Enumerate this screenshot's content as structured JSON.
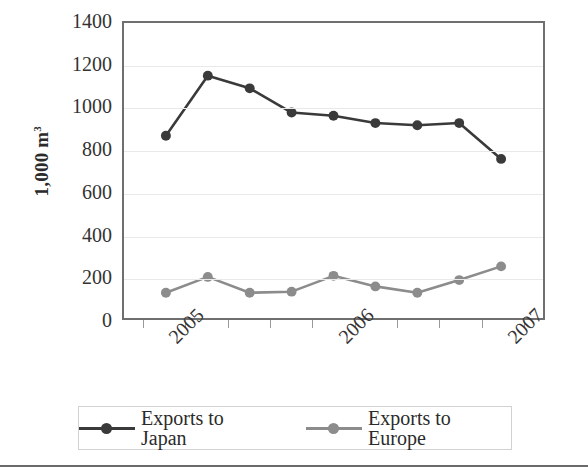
{
  "chart_data": {
    "type": "line",
    "title": "",
    "xlabel": "",
    "ylabel": "1,000 m",
    "ylabel_sup": "3",
    "ylim": [
      0,
      1400
    ],
    "ytick_step": 200,
    "yticks": [
      "0",
      "200",
      "400",
      "600",
      "800",
      "1000",
      "1200",
      "1400"
    ],
    "xticks": [
      "2005",
      "2006",
      "2007"
    ],
    "xtick_positions": [
      0.5,
      4.5,
      8.5
    ],
    "x": [
      1,
      2,
      3,
      4,
      5,
      6,
      7,
      8,
      9
    ],
    "grid": "horizontal",
    "legend_position": "bottom",
    "series": [
      {
        "name": "Exports to Japan",
        "color": "#3a3a3a",
        "marker": "circle",
        "values": [
          865,
          1150,
          1090,
          975,
          960,
          925,
          915,
          925,
          755
        ]
      },
      {
        "name": "Exports to Europe",
        "color": "#8c8c8c",
        "marker": "circle",
        "values": [
          120,
          195,
          120,
          125,
          200,
          150,
          120,
          180,
          245
        ]
      }
    ]
  },
  "legend": {
    "items": [
      {
        "label": "Exports to Japan",
        "color": "#3a3a3a"
      },
      {
        "label": "Exports to Europe",
        "color": "#8c8c8c"
      }
    ]
  },
  "colors": {
    "japan": "#3a3a3a",
    "europe": "#8c8c8c",
    "axis": "#6f6f6f",
    "grid": "#e9e9e9",
    "text": "#2b2b2b"
  }
}
